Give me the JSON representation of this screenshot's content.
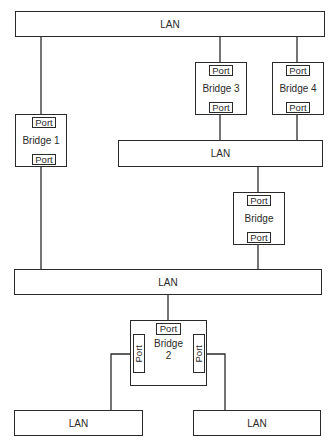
{
  "diagram": {
    "lans": [
      {
        "id": "lan-top",
        "label": "LAN"
      },
      {
        "id": "lan-middle",
        "label": "LAN"
      },
      {
        "id": "lan-lower",
        "label": "LAN"
      },
      {
        "id": "lan-bottom-left",
        "label": "LAN"
      },
      {
        "id": "lan-bottom-right",
        "label": "LAN"
      }
    ],
    "bridges": [
      {
        "id": "bridge-1",
        "label": "Bridge 1",
        "ports": [
          "Port",
          "Port"
        ]
      },
      {
        "id": "bridge-3",
        "label": "Bridge 3",
        "ports": [
          "Port",
          "Port"
        ]
      },
      {
        "id": "bridge-4",
        "label": "Bridge 4",
        "ports": [
          "Port",
          "Port"
        ]
      },
      {
        "id": "bridge",
        "label": "Bridge",
        "ports": [
          "Port",
          "Port"
        ]
      },
      {
        "id": "bridge-2",
        "label_line1": "Bridge",
        "label_line2": "2",
        "ports": [
          "Port",
          "Port",
          "Port"
        ]
      }
    ],
    "line_color": "#2a2a2a"
  }
}
